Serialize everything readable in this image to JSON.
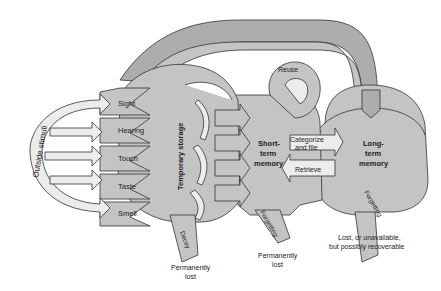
{
  "diagram": {
    "colors": {
      "fill": "#c4c4c4",
      "fill_dark": "#a9a9a9",
      "fill_light": "#e6e6e6",
      "stroke": "#333333",
      "text": "#222222",
      "background": "#ffffff"
    },
    "input": {
      "label": "Outside stimuli"
    },
    "senses": [
      {
        "label": "Sight",
        "icon": "eye-icon"
      },
      {
        "label": "Hearing",
        "icon": "ear-icon"
      },
      {
        "label": "Touch",
        "icon": "hand-icon"
      },
      {
        "label": "Taste",
        "icon": "mouth-icon"
      },
      {
        "label": "Smell",
        "icon": "nose-icon"
      }
    ],
    "stages": {
      "sensory": {
        "label": "Temporary storage"
      },
      "short_term": {
        "label_line1": "Short-",
        "label_line2": "term",
        "label_line3": "memory"
      },
      "long_term": {
        "label_line1": "Long-",
        "label_line2": "term",
        "label_line3": "memory"
      }
    },
    "processes": {
      "reuse": "Reuse",
      "categorize_line1": "Categorize",
      "categorize_line2": "and file",
      "retrieve": "Retrieve",
      "decay": "Decay",
      "forgetting_stm": "Forgetting",
      "forgetting_ltm": "Forgetting"
    },
    "outcomes": {
      "sensory_line1": "Permanently",
      "sensory_line2": "lost",
      "stm_line1": "Permanently",
      "stm_line2": "lost",
      "ltm_line1": "Lost, or unavailable,",
      "ltm_line2": "but possibly recoverable"
    }
  }
}
